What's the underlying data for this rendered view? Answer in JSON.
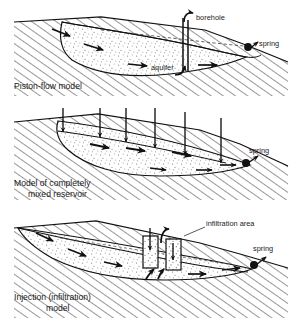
{
  "figure": {
    "colors": {
      "ink": "#1a1a1a",
      "rock_hatch": "#1a1a1a",
      "aquifer_fill": "#ffffff",
      "stipple": "#6e6e6e",
      "background": "#ffffff"
    }
  },
  "panels": [
    {
      "id": "piston-flow",
      "caption": "Piston-flow model",
      "annotations": [
        {
          "name": "borehole",
          "label": "borehole"
        },
        {
          "name": "aquifer",
          "label": "aquifer"
        },
        {
          "name": "spring",
          "label": "spring"
        }
      ],
      "flow_arrows": 6,
      "arrow_direction": "horizontal-right"
    },
    {
      "id": "completely-mixed-reservoir",
      "caption_line1": "Model of completely",
      "caption_line2": "mixed reservoir",
      "annotations": [
        {
          "name": "spring",
          "label": "spring"
        }
      ],
      "recharge_arrows": 6,
      "flow_arrows": 8,
      "arrow_direction": "vertical-down-and-horizontal-right"
    },
    {
      "id": "injection-infiltration",
      "caption_line1": "Injection (infiltration)",
      "caption_line2": "model",
      "annotations": [
        {
          "name": "infiltration-area",
          "label": "infiltration area"
        },
        {
          "name": "spring",
          "label": "spring"
        }
      ],
      "infiltration_shafts": 2,
      "flow_arrows": 7,
      "arrow_direction": "horizontal-right"
    }
  ]
}
